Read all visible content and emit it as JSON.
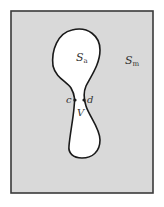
{
  "diagram": {
    "background_color": "#d9d9d9",
    "frame_color": "#3a3a3a",
    "region_fill": "#ffffff",
    "outline_color": "#1a1a1a",
    "labels": {
      "inner_region": {
        "main": "S",
        "sub": "a"
      },
      "outer_region": {
        "main": "S",
        "sub": "m"
      },
      "point_c": "c",
      "point_d": "d",
      "neck": "V"
    }
  }
}
